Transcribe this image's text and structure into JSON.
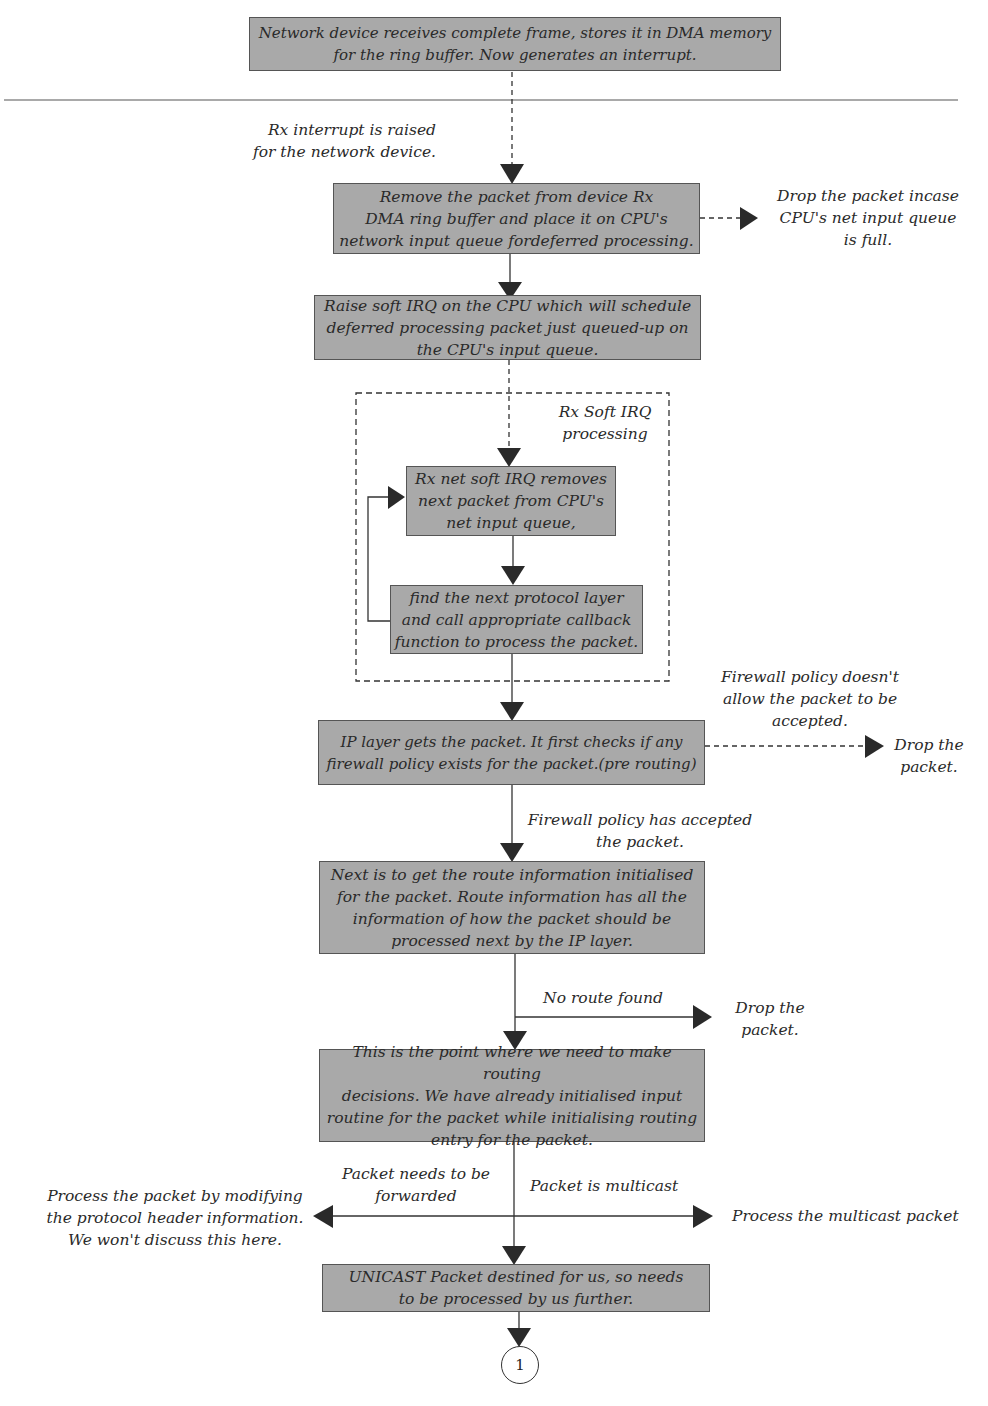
{
  "diagram": {
    "nodes": {
      "n1": "Network device receives complete frame, stores it in DMA memory\nfor the ring buffer. Now generates an interrupt.",
      "n2": "Remove the packet from device Rx\nDMA ring buffer and place it on CPU's\nnetwork input queue fordeferred processing.",
      "n3": "Raise soft IRQ on the CPU which will schedule\ndeferred processing packet just queued-up on\nthe CPU's input queue.",
      "n4": "Rx net soft IRQ removes\nnext packet from CPU's\nnet input queue,",
      "n5": "find the next protocol layer\nand call appropriate callback\nfunction to process the packet.",
      "n6": "IP layer gets the packet. It first checks if any\nfirewall policy exists for the packet.(pre routing)",
      "n7": "Next is to get the route information initialised\nfor the packet. Route information has all the\ninformation of how the packet should be\nprocessed next by the IP layer.",
      "n8": "This is the point where we need to make routing\ndecisions. We have already initialised input\nroutine for the packet while initialising routing\nentry for the packet.",
      "n9": "UNICAST Packet destined for us, so needs\nto be processed by us further."
    },
    "labels": {
      "rx_interrupt": "Rx interrupt is raised\nfor the network device.",
      "drop_queue_full": "Drop the packet incase\nCPU's net input queue\nis full.",
      "softirq_group": "Rx Soft IRQ\nprocessing",
      "firewall_denied": "Firewall policy doesn't\nallow the packet to be\naccepted.",
      "drop_firewall": "Drop the\npacket.",
      "firewall_accepted": "Firewall policy has accepted\nthe packet.",
      "no_route": "No route found",
      "drop_no_route": "Drop the\npacket.",
      "needs_forward": "Packet needs to be\nforwarded",
      "forward_action": "Process the packet by modifying\nthe protocol header information.\nWe won't discuss this here.",
      "is_multicast": "Packet is multicast",
      "multicast_action": "Process the multicast packet"
    },
    "connector_label": "1"
  }
}
